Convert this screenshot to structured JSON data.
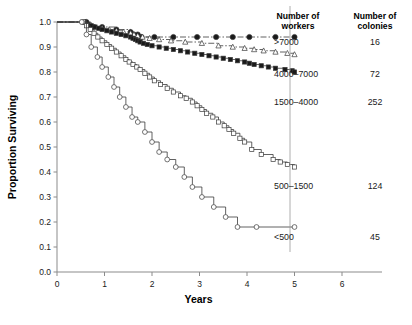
{
  "chart_data": {
    "type": "line",
    "title": "",
    "xlabel": "Years",
    "ylabel": "Proportion Surviving",
    "xlim": [
      0,
      6.8
    ],
    "ylim": [
      0,
      1.0
    ],
    "xticks": [
      "0",
      "1",
      "2",
      "3",
      "4",
      "5",
      "6"
    ],
    "xtick_values": [
      0,
      1,
      2,
      3,
      4,
      5,
      6
    ],
    "yticks": [
      "0.0",
      "0.1",
      "0.2",
      "0.3",
      "0.4",
      "0.5",
      "0.6",
      "0.7",
      "0.8",
      "0.9",
      "1.0"
    ],
    "ytick_values": [
      0.0,
      0.1,
      0.2,
      0.3,
      0.4,
      0.5,
      0.6,
      0.7,
      0.8,
      0.9,
      1.0
    ],
    "grid": false,
    "legend_position": "right",
    "legend_headers": [
      "Number of workers",
      "Number of colonies"
    ],
    "series": [
      {
        "name": ">7000",
        "colonies": 16,
        "marker": "filled-circle",
        "linestyle": "dash-dot",
        "x": [
          0.0,
          0.62,
          0.72,
          0.95,
          1.25,
          1.55,
          1.62,
          1.7,
          1.78,
          2.05,
          2.45,
          2.95,
          3.35,
          3.7,
          4.05,
          4.6,
          5.0
        ],
        "y": [
          1.0,
          1.0,
          0.98,
          0.98,
          0.97,
          0.96,
          0.95,
          0.95,
          0.94,
          0.94,
          0.94,
          0.94,
          0.94,
          0.94,
          0.94,
          0.94,
          0.94
        ]
      },
      {
        "name": "4000–7000",
        "colonies": 72,
        "marker": "triangle",
        "linestyle": "dash-dot",
        "x": [
          0.0,
          0.6,
          0.7,
          0.8,
          0.95,
          1.1,
          1.25,
          1.4,
          1.55,
          1.62,
          1.7,
          1.8,
          1.95,
          2.15,
          2.4,
          2.7,
          3.05,
          3.4,
          3.7,
          3.95,
          4.15,
          4.35,
          4.6,
          4.85,
          5.0
        ],
        "y": [
          1.0,
          1.0,
          0.99,
          0.98,
          0.975,
          0.97,
          0.965,
          0.96,
          0.955,
          0.95,
          0.945,
          0.94,
          0.935,
          0.93,
          0.925,
          0.92,
          0.915,
          0.905,
          0.9,
          0.895,
          0.89,
          0.885,
          0.88,
          0.875,
          0.87
        ]
      },
      {
        "name": "1500–4000",
        "colonies": 252,
        "marker": "square-filled",
        "linestyle": "solid",
        "x": [
          0.0,
          0.58,
          0.65,
          0.72,
          0.8,
          0.88,
          0.95,
          1.05,
          1.15,
          1.25,
          1.35,
          1.45,
          1.55,
          1.6,
          1.65,
          1.7,
          1.75,
          1.82,
          1.9,
          2.0,
          2.15,
          2.3,
          2.45,
          2.6,
          2.75,
          2.9,
          3.05,
          3.2,
          3.35,
          3.5,
          3.65,
          3.8,
          3.95,
          4.05,
          4.15,
          4.3,
          4.45,
          4.6,
          4.8,
          4.95,
          5.0
        ],
        "y": [
          1.0,
          1.0,
          0.99,
          0.985,
          0.98,
          0.975,
          0.97,
          0.965,
          0.96,
          0.955,
          0.95,
          0.945,
          0.94,
          0.935,
          0.93,
          0.925,
          0.92,
          0.915,
          0.91,
          0.905,
          0.9,
          0.895,
          0.89,
          0.885,
          0.88,
          0.875,
          0.87,
          0.865,
          0.86,
          0.855,
          0.85,
          0.845,
          0.84,
          0.835,
          0.83,
          0.825,
          0.82,
          0.815,
          0.81,
          0.805,
          0.8
        ]
      },
      {
        "name": "500–1500",
        "colonies": 124,
        "marker": "open-square",
        "linestyle": "solid-dotted",
        "x": [
          0.0,
          0.55,
          0.62,
          0.7,
          0.78,
          0.86,
          0.95,
          1.05,
          1.15,
          1.25,
          1.35,
          1.45,
          1.52,
          1.6,
          1.68,
          1.75,
          1.85,
          1.95,
          2.05,
          2.18,
          2.32,
          2.45,
          2.6,
          2.72,
          2.85,
          2.95,
          3.05,
          3.15,
          3.28,
          3.4,
          3.52,
          3.62,
          3.72,
          3.85,
          3.95,
          4.1,
          4.3,
          4.55,
          4.7,
          4.85,
          5.0
        ],
        "y": [
          1.0,
          1.0,
          0.985,
          0.97,
          0.955,
          0.94,
          0.925,
          0.91,
          0.895,
          0.88,
          0.865,
          0.85,
          0.84,
          0.83,
          0.82,
          0.81,
          0.795,
          0.78,
          0.765,
          0.75,
          0.735,
          0.72,
          0.705,
          0.695,
          0.68,
          0.665,
          0.65,
          0.635,
          0.62,
          0.6,
          0.585,
          0.57,
          0.555,
          0.535,
          0.52,
          0.49,
          0.47,
          0.45,
          0.44,
          0.43,
          0.42
        ]
      },
      {
        "name": "<500",
        "colonies": 45,
        "marker": "open-circle",
        "linestyle": "solid-step",
        "x": [
          0.0,
          0.52,
          0.62,
          0.72,
          0.85,
          0.95,
          1.08,
          1.2,
          1.32,
          1.45,
          1.58,
          1.7,
          1.85,
          2.0,
          2.15,
          2.32,
          2.5,
          2.68,
          2.85,
          3.05,
          3.3,
          3.55,
          3.8,
          4.2,
          5.0
        ],
        "y": [
          1.0,
          1.0,
          0.95,
          0.9,
          0.86,
          0.82,
          0.78,
          0.74,
          0.7,
          0.66,
          0.62,
          0.6,
          0.56,
          0.52,
          0.48,
          0.45,
          0.42,
          0.38,
          0.34,
          0.3,
          0.26,
          0.22,
          0.18,
          0.18,
          0.18
        ]
      }
    ]
  },
  "axes": {
    "ylabel": "Proportion Surviving",
    "xlabel": "Years",
    "yticks": [
      "1.0",
      "0.9",
      "0.8",
      "0.7",
      "0.6",
      "0.5",
      "0.4",
      "0.3",
      "0.2",
      "0.1",
      "0.0"
    ],
    "xticks": [
      "0",
      "1",
      "2",
      "3",
      "4",
      "5",
      "6"
    ]
  },
  "legend": {
    "header_col1_line1": "Number of",
    "header_col1_line2": "workers",
    "header_col2_line1": "Number of",
    "header_col2_line2": "colonies",
    "rows": [
      {
        "label": ">7000",
        "count": "16"
      },
      {
        "label": "4000–7000",
        "count": "72"
      },
      {
        "label": "1500–4000",
        "count": "252"
      },
      {
        "label": "500–1500",
        "count": "124"
      },
      {
        "label": "<500",
        "count": "45"
      }
    ]
  },
  "colors": {
    "line": "#3a3a3a",
    "axis": "#8b8b8b",
    "text": "#1a1a1a"
  }
}
